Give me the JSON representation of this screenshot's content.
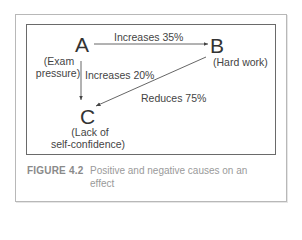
{
  "figure": {
    "nodes": [
      {
        "id": "A",
        "letter": "A",
        "label_line1": "(Exam",
        "label_line2": "pressure)"
      },
      {
        "id": "B",
        "letter": "B",
        "label": "(Hard work)"
      },
      {
        "id": "C",
        "letter": "C",
        "label_line1": "(Lack of",
        "label_line2": "self-confidence)"
      }
    ],
    "edges": [
      {
        "from": "A",
        "to": "B",
        "label": "Increases 35%"
      },
      {
        "from": "A",
        "to": "C",
        "label": "Increases 20%"
      },
      {
        "from": "B",
        "to": "C",
        "label": "Reduces 75%"
      }
    ],
    "caption": {
      "number": "FIGURE 4.2",
      "text": "Positive and negative causes on an effect"
    }
  },
  "colors": {
    "text": "#333333",
    "caption": "#9a9a9a",
    "inner_border": "#6a6a6a",
    "outer_border": "#b8b8b8"
  }
}
